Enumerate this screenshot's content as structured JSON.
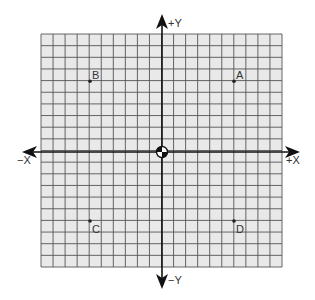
{
  "diagram": {
    "type": "coordinate-plane",
    "grid": {
      "cells_x": 20,
      "cells_y": 20,
      "units_per_side": 10,
      "fill_color": "#e9e9e9",
      "line_color": "#555555",
      "axis_color": "#111111"
    },
    "axes": {
      "pos_x_label": "+X",
      "neg_x_label": "−X",
      "pos_y_label": "+Y",
      "neg_y_label": "−Y"
    },
    "origin": {
      "x": 0,
      "y": 0,
      "symbol": "origin-target-icon"
    },
    "points": [
      {
        "label": "A",
        "x": 6,
        "y": 6
      },
      {
        "label": "B",
        "x": -6,
        "y": 6
      },
      {
        "label": "C",
        "x": -6,
        "y": -6
      },
      {
        "label": "D",
        "x": 6,
        "y": -6
      }
    ]
  }
}
